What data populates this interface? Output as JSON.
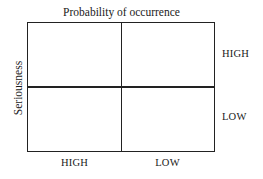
{
  "diagram": {
    "type": "2x2 matrix",
    "title": "Probability of occurrence",
    "y_axis_label": "Seriousness",
    "column_labels": [
      "HIGH",
      "LOW"
    ],
    "row_labels": [
      "HIGH",
      "LOW"
    ],
    "cells": [
      {
        "row": "HIGH",
        "column": "HIGH",
        "text": ""
      },
      {
        "row": "HIGH",
        "column": "LOW",
        "text": ""
      },
      {
        "row": "LOW",
        "column": "HIGH",
        "text": ""
      },
      {
        "row": "LOW",
        "column": "LOW",
        "text": ""
      }
    ],
    "colors": {
      "line": "#222222",
      "text": "#1a1a1a",
      "background": "#ffffff"
    }
  }
}
